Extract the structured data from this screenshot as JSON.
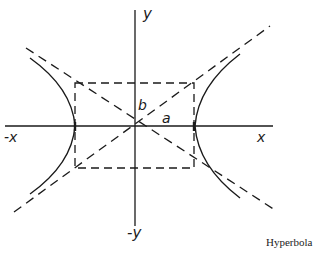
{
  "diagram": {
    "type": "hyperbola",
    "caption": "Hyperbola",
    "labels": {
      "x_pos": "x",
      "x_neg": "-x",
      "y_pos": "y",
      "y_neg": "-y",
      "semi_major": "a",
      "semi_minor": "b"
    },
    "colors": {
      "ink": "#1a1a1a",
      "background": "#ffffff"
    },
    "geometry": {
      "center": [
        134,
        126
      ],
      "a_px": 60,
      "b_px": 43,
      "x_axis": [
        5,
        273
      ],
      "y_axis": [
        10,
        226
      ]
    }
  }
}
